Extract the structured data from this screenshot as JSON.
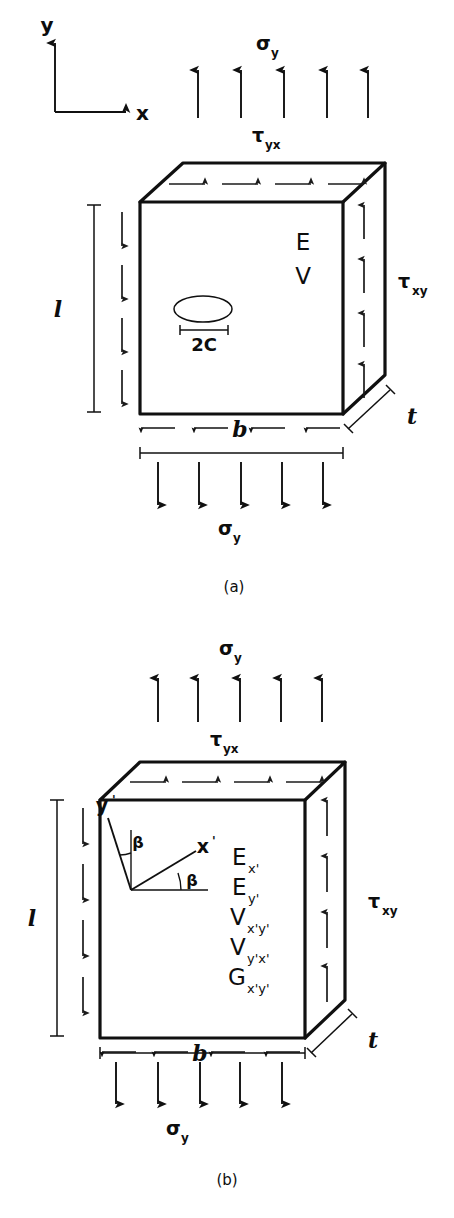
{
  "figure": {
    "caption_a": "(a)",
    "caption_b": "(b)",
    "background_color": "#ffffff",
    "ink_color": "#101010"
  },
  "global_axes": {
    "y_label": "y",
    "x_label": "x",
    "description": "global coordinate triad, y up and x right"
  },
  "panel_a": {
    "top_stress_label": "σ",
    "top_stress_sub": "y",
    "top_shear_label": "τ",
    "top_shear_sub": "yx",
    "right_shear_label": "τ",
    "right_shear_sub": "xy",
    "bottom_stress_label": "σ",
    "bottom_stress_sub": "y",
    "height_dim_label": "l",
    "width_dim_label": "b",
    "thickness_dim_label": "t",
    "crack_dim_label": "2C",
    "material_props": [
      "E",
      "V"
    ],
    "top_arrow_count": 5,
    "bottom_arrow_count": 5,
    "left_arrow_count": 4,
    "right_arrow_count": 4,
    "top_shear_arrow_count": 4,
    "bottom_shear_arrow_count": 4
  },
  "panel_b": {
    "top_stress_label": "σ",
    "top_stress_sub": "y",
    "top_shear_label": "τ",
    "top_shear_sub": "yx",
    "right_shear_label": "τ",
    "right_shear_sub": "xy",
    "bottom_stress_label": "σ",
    "bottom_stress_sub": "y",
    "height_dim_label": "l",
    "width_dim_label": "b",
    "thickness_dim_label": "t",
    "angle_label_upper": "β",
    "angle_label_lower": "β",
    "local_axis_y_label": "y",
    "local_axis_y_prime": "'",
    "local_axis_x_label": "x",
    "local_axis_x_prime": "'",
    "material_props": [
      {
        "symbol": "E",
        "sub": "x'"
      },
      {
        "symbol": "E",
        "sub": "y'"
      },
      {
        "symbol": "V",
        "sub": "x'y'"
      },
      {
        "symbol": "V",
        "sub": "y'x'"
      },
      {
        "symbol": "G",
        "sub": "x'y'"
      }
    ],
    "top_arrow_count": 5,
    "bottom_arrow_count": 5,
    "left_arrow_count": 4,
    "right_arrow_count": 4,
    "top_shear_arrow_count": 4,
    "bottom_shear_arrow_count": 4
  }
}
